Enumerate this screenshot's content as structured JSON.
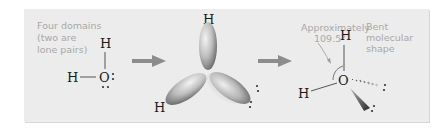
{
  "figure": {
    "step1": {
      "caption_lines": [
        "Four domains",
        "(two are",
        "lone pairs)"
      ],
      "atoms": {
        "top_h": "H",
        "left_h": "H",
        "center": "O"
      }
    },
    "step2": {
      "atoms": {
        "top_h": "H",
        "left_h": "H"
      }
    },
    "step3": {
      "angle_label_lines": [
        "Approximately",
        "109.5°"
      ],
      "shape_label_lines": [
        "Bent",
        "molecular",
        "shape"
      ],
      "atoms": {
        "top_h": "H",
        "left_h": "H",
        "center": "O"
      }
    },
    "colors": {
      "panel": "#ececec",
      "arrow": "#8c8c8c",
      "label_text": "#a8a8a8",
      "atom_text": "#1a1a1a"
    }
  }
}
